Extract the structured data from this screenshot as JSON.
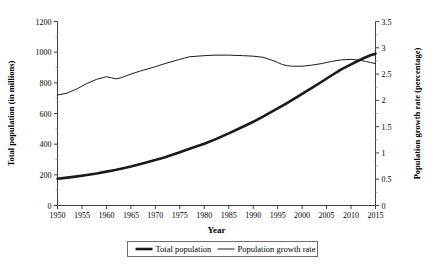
{
  "chart_data": {
    "type": "line",
    "title": "",
    "xlabel": "Year",
    "ylabel": "Total population (in millions)",
    "y2label": "Population growth rate (percentage)",
    "xlim": [
      1950,
      2015
    ],
    "ylim": [
      0,
      1200
    ],
    "y2lim": [
      0,
      3.5
    ],
    "xticks": [
      1950,
      1955,
      1960,
      1965,
      1970,
      1975,
      1980,
      1985,
      1990,
      1995,
      2000,
      2005,
      2010,
      2015
    ],
    "xtick_labels": [
      "1950",
      "1955",
      "1960",
      "1965",
      "1970",
      "1975",
      "1980",
      "1985",
      "1990",
      "1995",
      "2000",
      "2005",
      "2010",
      "2015"
    ],
    "yticks": [
      0,
      200,
      400,
      600,
      800,
      1000,
      1200
    ],
    "ytick_labels": [
      "0",
      "200",
      "400",
      "600",
      "800",
      "1000",
      "1200"
    ],
    "y2ticks": [
      0,
      0.5,
      1,
      1.5,
      2,
      2.5,
      3,
      3.5
    ],
    "y2tick_labels": [
      "0",
      "0.5",
      "1",
      "1.5",
      "2",
      "2.5",
      "3",
      "3.5"
    ],
    "grid": false,
    "legend_position": "bottom-center",
    "x": [
      1950,
      1952,
      1954,
      1956,
      1958,
      1960,
      1961,
      1962,
      1963,
      1965,
      1967,
      1970,
      1972,
      1975,
      1977,
      1980,
      1982,
      1985,
      1988,
      1990,
      1992,
      1994,
      1995,
      1996,
      1997,
      1998,
      2000,
      2002,
      2004,
      2006,
      2008,
      2010,
      2012,
      2013,
      2014,
      2015
    ],
    "series": [
      {
        "name": "Total population",
        "axis": "left",
        "unit": "millions",
        "line_width": "thick",
        "color": "#1a1a1a",
        "values": [
          175,
          182,
          190,
          199,
          209,
          221,
          227,
          233,
          240,
          254,
          270,
          296,
          315,
          347,
          370,
          403,
          428,
          470,
          515,
          546,
          580,
          615,
          633,
          651,
          670,
          689,
          728,
          767,
          807,
          848,
          888,
          920,
          952,
          967,
          980,
          990
        ]
      },
      {
        "name": "Population growth rate",
        "axis": "right",
        "unit": "percentage",
        "line_width": "thin",
        "color": "#1a1a1a",
        "values": [
          2.1,
          2.14,
          2.22,
          2.32,
          2.4,
          2.45,
          2.43,
          2.41,
          2.43,
          2.5,
          2.56,
          2.64,
          2.7,
          2.78,
          2.83,
          2.85,
          2.86,
          2.86,
          2.85,
          2.84,
          2.82,
          2.76,
          2.72,
          2.68,
          2.66,
          2.65,
          2.65,
          2.67,
          2.7,
          2.74,
          2.77,
          2.78,
          2.76,
          2.74,
          2.72,
          2.7
        ]
      }
    ],
    "legend": [
      {
        "label": "Total population",
        "style": "thick-line"
      },
      {
        "label": "Population growth rate",
        "style": "thin-line"
      }
    ]
  }
}
